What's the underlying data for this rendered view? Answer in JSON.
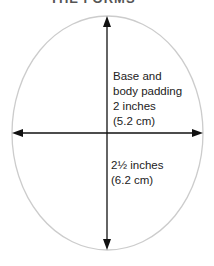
{
  "title": "THE FORMS",
  "diagram": {
    "shape": "oval",
    "width_label": [
      "Base and",
      "body padding",
      "2 inches",
      "(5.2 cm)"
    ],
    "height_label": [
      "2½ inches",
      "(6.2 cm)"
    ]
  },
  "colors": {
    "outline": "#cccccc",
    "arrow": "#111111",
    "text": "#222222"
  }
}
